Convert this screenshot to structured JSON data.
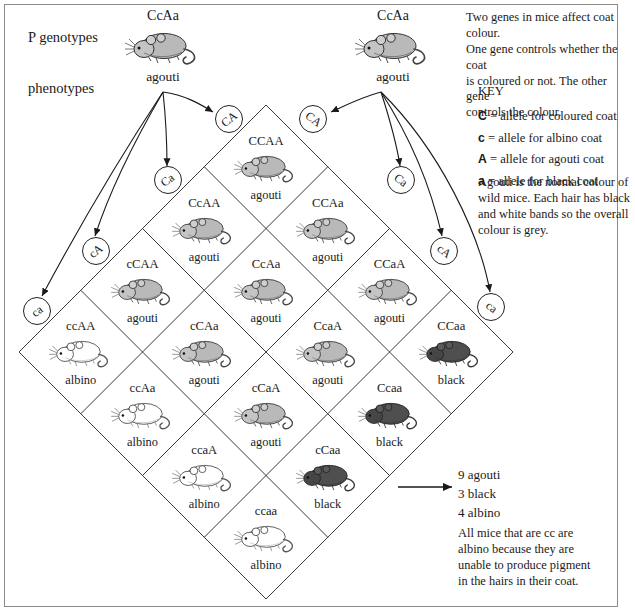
{
  "labels": {
    "p_genotypes": "P genotypes",
    "phenotypes": "phenotypes"
  },
  "parents": [
    {
      "name": "parent-left",
      "genotype": "CcAa",
      "phenotype": "agouti",
      "coat": "agouti"
    },
    {
      "name": "parent-right",
      "genotype": "CcAa",
      "phenotype": "agouti",
      "coat": "agouti"
    }
  ],
  "gametes": {
    "left_parent": [
      "CA",
      "Ca",
      "cA",
      "ca"
    ],
    "right_parent": [
      "CA",
      "Ca",
      "cA",
      "ca"
    ]
  },
  "punnett": {
    "rows": 4,
    "cols": 4,
    "cells": [
      {
        "genotype": "CCAA",
        "phenotype": "agouti",
        "coat": "agouti"
      },
      {
        "genotype": "CCAa",
        "phenotype": "agouti",
        "coat": "agouti"
      },
      {
        "genotype": "CCaA",
        "phenotype": "agouti",
        "coat": "agouti"
      },
      {
        "genotype": "CCaa",
        "phenotype": "black",
        "coat": "black"
      },
      {
        "genotype": "CcAA",
        "phenotype": "agouti",
        "coat": "agouti"
      },
      {
        "genotype": "CcAa",
        "phenotype": "agouti",
        "coat": "agouti"
      },
      {
        "genotype": "CcaA",
        "phenotype": "agouti",
        "coat": "agouti"
      },
      {
        "genotype": "Ccaa",
        "phenotype": "black",
        "coat": "black"
      },
      {
        "genotype": "cCAA",
        "phenotype": "agouti",
        "coat": "agouti"
      },
      {
        "genotype": "cCAa",
        "phenotype": "agouti",
        "coat": "agouti"
      },
      {
        "genotype": "cCaA",
        "phenotype": "agouti",
        "coat": "agouti"
      },
      {
        "genotype": "cCaa",
        "phenotype": "black",
        "coat": "black"
      },
      {
        "genotype": "ccAA",
        "phenotype": "albino",
        "coat": "albino"
      },
      {
        "genotype": "ccAa",
        "phenotype": "albino",
        "coat": "albino"
      },
      {
        "genotype": "ccaA",
        "phenotype": "albino",
        "coat": "albino"
      },
      {
        "genotype": "ccaa",
        "phenotype": "albino",
        "coat": "albino"
      }
    ]
  },
  "intro": [
    "Two genes in mice affect coat colour.",
    "One gene controls whether the coat",
    "is coloured or not. The other gene",
    "controls the colour."
  ],
  "key": {
    "heading": "KEY",
    "entries": [
      {
        "allele": "C",
        "text": "= allele for coloured coat"
      },
      {
        "allele": "c",
        "text": "= allele for albino coat"
      },
      {
        "allele": "A",
        "text": "= allele for agouti coat"
      },
      {
        "allele": "a",
        "text": "= allele for black coat"
      }
    ]
  },
  "agouti_note": [
    "Agouti is the normal colour of",
    "wild mice. Each hair has black",
    "and white bands so the overall",
    "colour is grey."
  ],
  "ratio": [
    "9 agouti",
    "3 black",
    "4 albino"
  ],
  "albino_note": [
    "All mice that are cc are",
    "albino because they are",
    "unable to produce pigment",
    "in the hairs in their coat."
  ],
  "colors": {
    "ink": "#1a1a1a",
    "frame": "#8a8a8a",
    "grid_line": "#3a3a3a",
    "agouti_body": "#b9b9b9",
    "black_body": "#4a4a4a",
    "albino_body": "#ffffff"
  }
}
